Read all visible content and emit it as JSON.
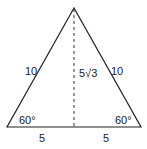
{
  "diagram": {
    "type": "equilateral-triangle-with-altitude",
    "vertices": {
      "apex": [
        74,
        8
      ],
      "bottom_left": [
        7,
        127
      ],
      "bottom_right": [
        141,
        127
      ]
    },
    "labels": {
      "left_side": "10",
      "right_side": "10",
      "altitude": "5√3",
      "left_angle": "60°",
      "right_angle": "60°",
      "left_half_base": "5",
      "right_half_base": "5"
    },
    "colors": {
      "stroke": "#222222",
      "background": "#ffffff"
    }
  }
}
